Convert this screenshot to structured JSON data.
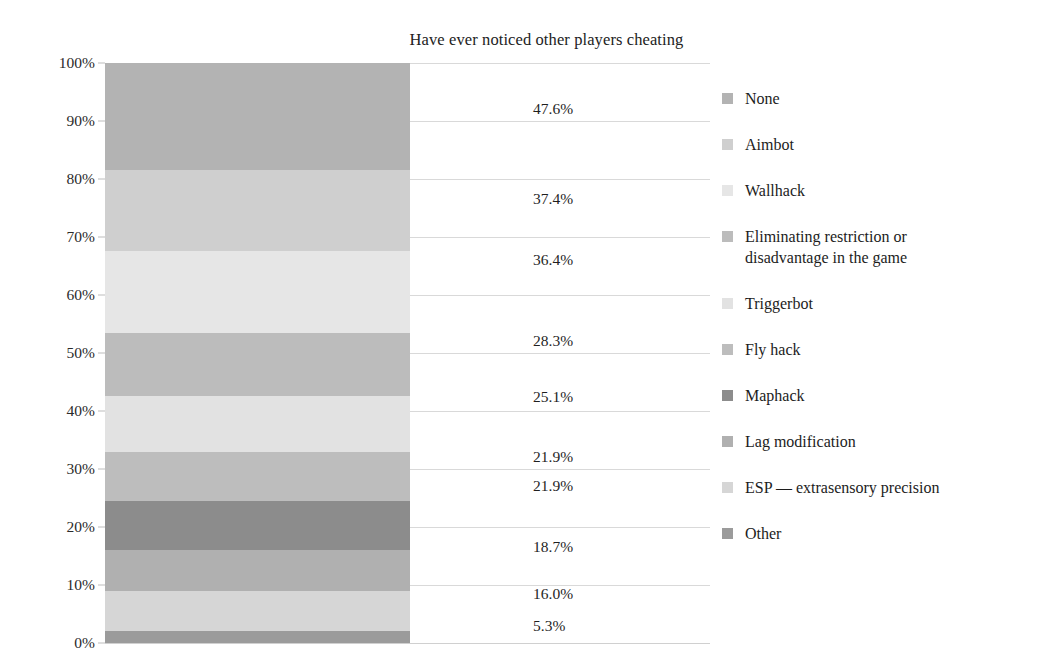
{
  "chart_data": {
    "type": "bar",
    "subtype": "stacked-100-percent-single-column",
    "title": "Have ever noticed other players cheating",
    "xlabel": "",
    "ylabel": "",
    "ylim": [
      0,
      100
    ],
    "grid": true,
    "legend_position": "right",
    "y_ticks": [
      "0%",
      "10%",
      "20%",
      "30%",
      "40%",
      "50%",
      "60%",
      "70%",
      "80%",
      "90%",
      "100%"
    ],
    "y_tick_values": [
      0,
      10,
      20,
      30,
      40,
      50,
      60,
      70,
      80,
      90,
      100
    ],
    "categories": [
      "None",
      "Aimbot",
      "Wallhack",
      "Eliminating restriction or disadvantage in the game",
      "Triggerbot",
      "Fly hack",
      "Maphack",
      "Lag modification",
      "ESP — extrasensory precision",
      "Other"
    ],
    "values": [
      47.6,
      37.4,
      36.4,
      28.3,
      25.1,
      21.9,
      21.9,
      18.7,
      16.0,
      5.3
    ],
    "value_labels": [
      "47.6%",
      "37.4%",
      "36.4%",
      "28.3%",
      "25.1%",
      "21.9%",
      "21.9%",
      "18.7%",
      "16.0%",
      "5.3%"
    ],
    "colors": [
      "#b3b3b3",
      "#cfcfcf",
      "#e6e6e6",
      "#bcbcbc",
      "#e2e2e2",
      "#bdbdbd",
      "#8c8c8c",
      "#b0b0b0",
      "#d6d6d6",
      "#9b9b9b"
    ],
    "segments": [
      {
        "label": "None",
        "value_label": "47.6%",
        "value": 47.6,
        "top_pct": 100.0,
        "bottom_pct": 81.5,
        "color": "#b3b3b3"
      },
      {
        "label": "Aimbot",
        "value_label": "37.4%",
        "value": 37.4,
        "top_pct": 81.5,
        "bottom_pct": 67.5,
        "color": "#cfcfcf"
      },
      {
        "label": "Wallhack",
        "value_label": "36.4%",
        "value": 36.4,
        "top_pct": 67.5,
        "bottom_pct": 53.5,
        "color": "#e6e6e6"
      },
      {
        "label": "Eliminating restriction or disadvantage in the game",
        "value_label": "28.3%",
        "value": 28.3,
        "top_pct": 53.5,
        "bottom_pct": 42.5,
        "color": "#bcbcbc"
      },
      {
        "label": "Triggerbot",
        "value_label": "25.1%",
        "value": 25.1,
        "top_pct": 42.5,
        "bottom_pct": 33.0,
        "color": "#e2e2e2"
      },
      {
        "label": "Fly hack",
        "value_label": "21.9%",
        "value": 21.9,
        "top_pct": 33.0,
        "bottom_pct": 24.5,
        "color": "#bdbdbd"
      },
      {
        "label": "Maphack",
        "value_label": "21.9%",
        "value": 21.9,
        "top_pct": 24.5,
        "bottom_pct": 16.0,
        "color": "#8c8c8c"
      },
      {
        "label": "Lag modification",
        "value_label": "18.7%",
        "value": 18.7,
        "top_pct": 16.0,
        "bottom_pct": 9.0,
        "color": "#b0b0b0"
      },
      {
        "label": "ESP — extrasensory precision",
        "value_label": "16.0%",
        "value": 16.0,
        "top_pct": 9.0,
        "bottom_pct": 2.0,
        "color": "#d6d6d6"
      },
      {
        "label": "Other",
        "value_label": "5.3%",
        "value": 5.3,
        "top_pct": 2.0,
        "bottom_pct": 0.0,
        "color": "#9b9b9b"
      }
    ],
    "label_positions_pct": [
      92.0,
      76.5,
      66.0,
      52.0,
      42.5,
      32.0,
      27.0,
      16.5,
      8.5,
      3.0
    ]
  },
  "legend": {
    "items": [
      {
        "label": "None",
        "color": "#b3b3b3"
      },
      {
        "label": "Aimbot",
        "color": "#cfcfcf"
      },
      {
        "label": "Wallhack",
        "color": "#e6e6e6"
      },
      {
        "label": "Eliminating restriction or\ndisadvantage in the game",
        "color": "#bcbcbc"
      },
      {
        "label": "Triggerbot",
        "color": "#e2e2e2"
      },
      {
        "label": "Fly hack",
        "color": "#bdbdbd"
      },
      {
        "label": "Maphack",
        "color": "#8c8c8c"
      },
      {
        "label": "Lag modification",
        "color": "#b0b0b0"
      },
      {
        "label": "ESP — extrasensory precision",
        "color": "#d6d6d6"
      },
      {
        "label": "Other",
        "color": "#9b9b9b"
      }
    ]
  },
  "style": {
    "gridline_color": "#d9d9d9",
    "text_color": "#1f1f1f",
    "background": "#ffffff"
  }
}
